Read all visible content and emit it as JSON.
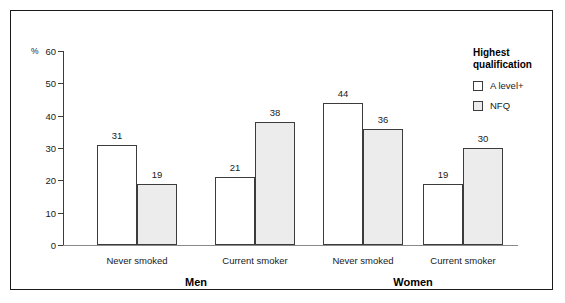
{
  "chart_data": {
    "type": "bar",
    "title": "",
    "xlabel": "",
    "ylabel": "%",
    "ylim": [
      0,
      60
    ],
    "yticks": [
      0,
      10,
      20,
      30,
      40,
      50,
      60
    ],
    "grid": false,
    "legend_position": "right",
    "legend_title": "Highest\nqualification",
    "categories": [
      "Never smoked",
      "Current smoker",
      "Never smoked",
      "Current smoker"
    ],
    "groups": [
      "Men",
      "Women"
    ],
    "series": [
      {
        "name": "A level+",
        "values": [
          31,
          21,
          44,
          19
        ],
        "color": "#ffffff"
      },
      {
        "name": "NFQ",
        "values": [
          19,
          38,
          36,
          30
        ],
        "color": "#ececec"
      }
    ]
  },
  "axis": {
    "unit_label": "%",
    "tick_labels": [
      "60",
      "50",
      "40",
      "30",
      "20",
      "10",
      "0"
    ]
  },
  "legend": {
    "title_line1": "Highest",
    "title_line2": "qualification",
    "entries": [
      {
        "label": "A level+"
      },
      {
        "label": "NFQ"
      }
    ]
  },
  "groups": [
    {
      "label": "Men"
    },
    {
      "label": "Women"
    }
  ],
  "categories": [
    {
      "label": "Never smoked"
    },
    {
      "label": "Current smoker"
    },
    {
      "label": "Never smoked"
    },
    {
      "label": "Current smoker"
    }
  ]
}
